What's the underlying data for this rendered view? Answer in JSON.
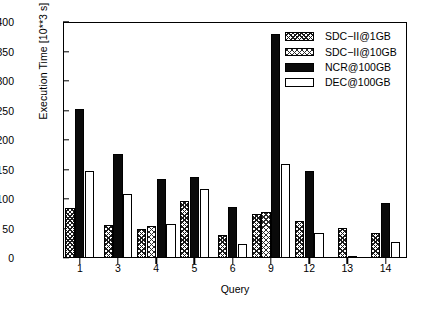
{
  "chart_data": {
    "type": "bar",
    "title": "",
    "xlabel": "Query",
    "ylabel": "Execution Time [10**3 s]",
    "categories": [
      "1",
      "3",
      "4",
      "5",
      "6",
      "9",
      "12",
      "13",
      "14"
    ],
    "ylim": [
      0,
      400
    ],
    "yticks": [
      0,
      50,
      100,
      150,
      200,
      250,
      300,
      350,
      400
    ],
    "grid": false,
    "legend_position": "top-right inside plot area",
    "series": [
      {
        "name": "SDC−II@1GB",
        "fill": "dense-crosshatch",
        "color": "#1a1a1a",
        "values": [
          85,
          56,
          49,
          96,
          39,
          75,
          62,
          51,
          42
        ]
      },
      {
        "name": "SDC−II@10GB",
        "fill": "light-crosshatch",
        "color": "#2b2b2b",
        "values": [
          null,
          null,
          55,
          null,
          null,
          78,
          null,
          null,
          null
        ]
      },
      {
        "name": "NCR@100GB",
        "fill": "solid-black",
        "color": "#0a0a0a",
        "values": [
          252,
          177,
          134,
          138,
          86,
          380,
          148,
          2,
          93
        ]
      },
      {
        "name": "DEC@100GB",
        "fill": "open-white",
        "color": "#ffffff",
        "values": [
          147,
          109,
          58,
          117,
          24,
          159,
          42,
          null,
          27
        ]
      }
    ]
  },
  "axis": {
    "y_title": "Execution Time [10**3 s]",
    "x_title": "Query",
    "y_tick_labels": [
      "0",
      "50",
      "100",
      "150",
      "200",
      "250",
      "300",
      "350",
      "400"
    ],
    "x_tick_labels": [
      "1",
      "3",
      "4",
      "5",
      "6",
      "9",
      "12",
      "13",
      "14"
    ]
  },
  "legend": {
    "entries": [
      {
        "label": "SDC−II@1GB"
      },
      {
        "label": "SDC−II@10GB"
      },
      {
        "label": "NCR@100GB"
      },
      {
        "label": "DEC@100GB"
      }
    ]
  }
}
